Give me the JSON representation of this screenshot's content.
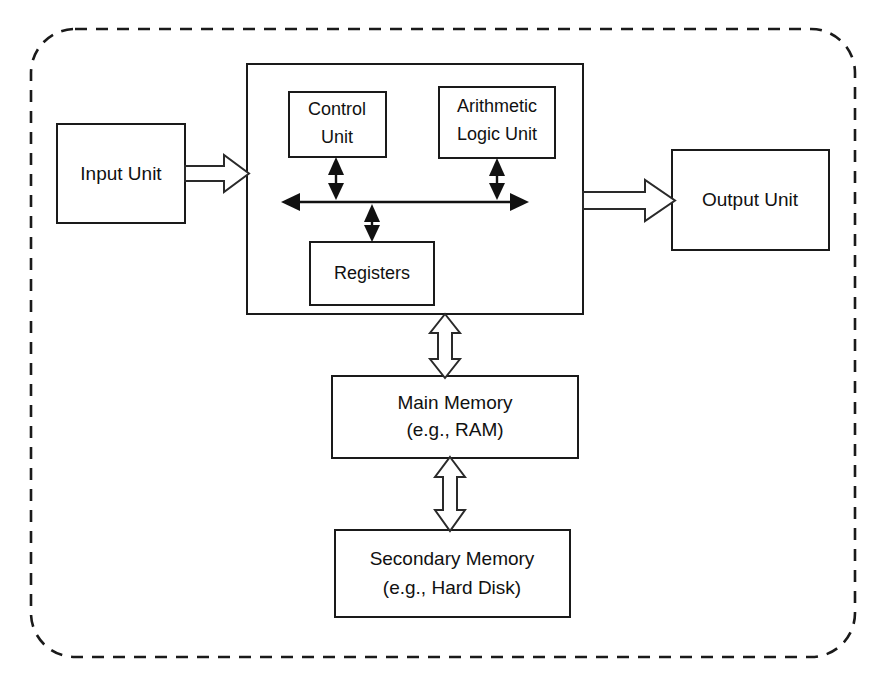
{
  "diagram": {
    "boundary": {
      "name": "computer-system-boundary",
      "style": "dashed-rounded-rectangle"
    },
    "blocks": {
      "input_unit": {
        "label": "Input Unit"
      },
      "output_unit": {
        "label": "Output Unit"
      },
      "cpu": {
        "label": ""
      },
      "control_unit": {
        "line1": "Control",
        "line2": "Unit"
      },
      "alu": {
        "line1": "Arithmetic",
        "line2": "Logic Unit"
      },
      "registers": {
        "label": "Registers"
      },
      "main_memory": {
        "line1": "Main Memory",
        "line2": "(e.g., RAM)"
      },
      "secondary_memory": {
        "line1": "Secondary Memory",
        "line2": "(e.g., Hard Disk)"
      }
    },
    "connectors": {
      "input_to_cpu": {
        "type": "block-arrow",
        "direction": "right"
      },
      "cpu_to_output": {
        "type": "block-arrow",
        "direction": "right"
      },
      "cpu_to_main_memory": {
        "type": "hollow-double-arrow",
        "direction": "vertical"
      },
      "main_to_secondary_memory": {
        "type": "hollow-double-arrow",
        "direction": "vertical"
      },
      "internal_bus": {
        "type": "double-headed-line",
        "direction": "horizontal"
      },
      "control_unit_to_bus": {
        "type": "double-headed-line",
        "direction": "vertical"
      },
      "alu_to_bus": {
        "type": "double-headed-line",
        "direction": "vertical"
      },
      "registers_to_bus": {
        "type": "double-headed-line",
        "direction": "vertical"
      }
    },
    "colors": {
      "stroke": "#1a1a1a",
      "fill": "#ffffff",
      "text": "#111111"
    }
  }
}
